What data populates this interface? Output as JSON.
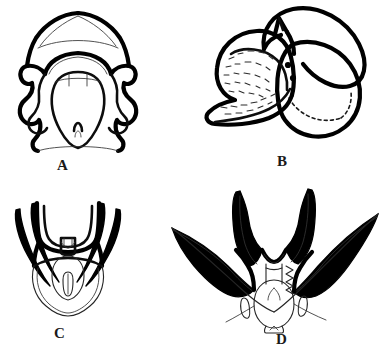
{
  "figure": {
    "kind": "scientific-illustration-plate",
    "background_color": "#ffffff",
    "ink_color": "#000000",
    "panel_count": 4,
    "layout": "2x2 grid",
    "panels": [
      {
        "id": "A",
        "label": "A",
        "position": "top-left",
        "view": "ventral",
        "description": "bilaterally symmetrical plate with peaked dome apex, thick wavy lateral lobes and central tongue-shaped median lobe"
      },
      {
        "id": "B",
        "label": "B",
        "position": "top-right",
        "view": "lateral",
        "description": "lateral aspect with stippled textured body, two solid dots, small apical spur and two large overlapping oval lobes"
      },
      {
        "id": "C",
        "label": "C",
        "position": "bottom-left",
        "view": "ventral",
        "description": "U-shaped frame bearing two slender elongate spines on each side above a thin-outlined rounded basal bulb"
      },
      {
        "id": "D",
        "label": "D",
        "position": "bottom-right",
        "view": "ventral",
        "description": "V-shaped structure with long sweeping lateral arms, two thick vertical median prongs and an oval basal body with notched tail"
      }
    ]
  }
}
